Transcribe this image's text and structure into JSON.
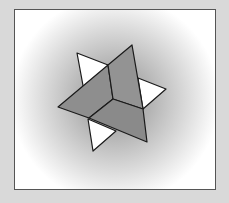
{
  "figure": {
    "title": "",
    "colors": {
      "background": "#d9d9d9",
      "frame_border": "#555555",
      "dark_face": "#8c8c8c",
      "mid_face": "#9a9a9a",
      "light_face": "#ffffff",
      "edge": "#1a1a1a"
    },
    "frame": {
      "x": 14,
      "y": 9,
      "width": 200,
      "height": 179
    },
    "faces": {
      "top_left_white": "77,53 108,65 89,118",
      "right_white": "138,78 166,89 143,109",
      "bottom_white": "88,119 116,131 93,151",
      "left_dark": "58,107 108,65 113,99 89,118",
      "top_dark": "108,65 132,45 143,109 113,99",
      "bottom_dark": "89,118 113,99 143,109 147,142"
    }
  }
}
